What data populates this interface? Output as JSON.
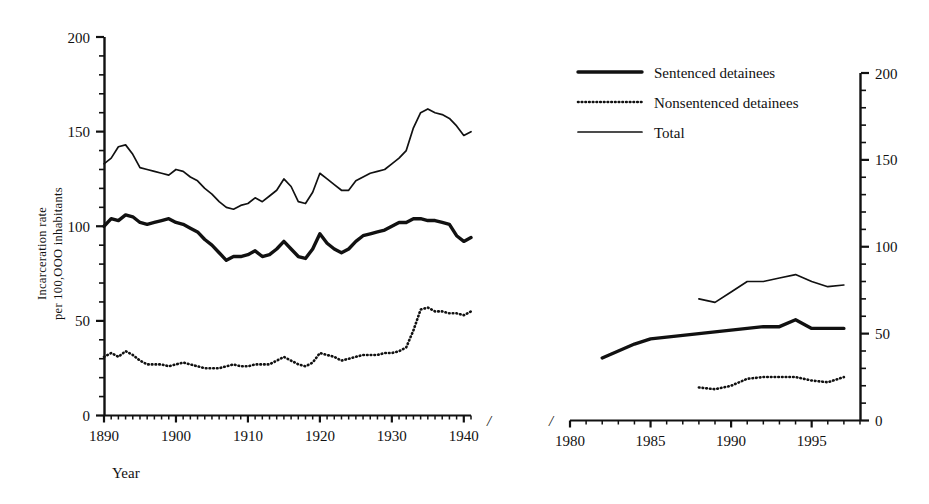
{
  "figure": {
    "background": "#ffffff",
    "ink": "#111111"
  },
  "axes": {
    "y_label_line1": "Incarceration rate",
    "y_label_line2": "per 100,OOO inhabitants",
    "x_label": "Year",
    "y_ticks": [
      "0",
      "50",
      "100",
      "150",
      "200"
    ],
    "y_tick_values": [
      0,
      50,
      100,
      150,
      200
    ],
    "y_minor_step": 10,
    "left_x_ticks": [
      "1890",
      "1900",
      "1910",
      "1920",
      "1930",
      "1940"
    ],
    "left_x_tick_values": [
      1890,
      1900,
      1910,
      1920,
      1930,
      1940
    ],
    "right_x_ticks": [
      "1980",
      "1985",
      "1990",
      "1995"
    ],
    "right_x_tick_values": [
      1980,
      1985,
      1990,
      1995
    ],
    "axis_break_glyph": "/"
  },
  "legend": {
    "position": "top-right",
    "items": [
      {
        "label": "Sentenced detainees",
        "style": "thick-solid"
      },
      {
        "label": "Nonsentenced detainees",
        "style": "dotted"
      },
      {
        "label": "Total",
        "style": "thin-solid"
      }
    ]
  },
  "chart_data": {
    "type": "line",
    "title": "",
    "xlabel": "Year",
    "ylabel": "Incarceration rate per 100,000 inhabitants",
    "ylim": [
      0,
      200
    ],
    "grid": false,
    "legend_position": "top-right",
    "axis_break": true,
    "panels": [
      {
        "name": "left-panel",
        "xlim": [
          1890,
          1941
        ],
        "series": [
          {
            "name": "Total",
            "style": "thin-solid",
            "x": [
              1890,
              1891,
              1892,
              1893,
              1894,
              1895,
              1896,
              1897,
              1898,
              1899,
              1900,
              1901,
              1902,
              1903,
              1904,
              1905,
              1906,
              1907,
              1908,
              1909,
              1910,
              1911,
              1912,
              1913,
              1914,
              1915,
              1916,
              1917,
              1918,
              1919,
              1920,
              1921,
              1922,
              1923,
              1924,
              1925,
              1926,
              1927,
              1928,
              1929,
              1930,
              1931,
              1932,
              1933,
              1934,
              1935,
              1936,
              1937,
              1938,
              1939,
              1940,
              1941
            ],
            "y": [
              133,
              136,
              142,
              143,
              138,
              131,
              130,
              129,
              128,
              127,
              130,
              129,
              126,
              124,
              120,
              117,
              113,
              110,
              109,
              111,
              112,
              115,
              113,
              116,
              119,
              125,
              121,
              113,
              112,
              118,
              128,
              125,
              122,
              119,
              119,
              124,
              126,
              128,
              129,
              130,
              133,
              136,
              140,
              152,
              160,
              162,
              160,
              159,
              157,
              153,
              148,
              150
            ]
          },
          {
            "name": "Sentenced detainees",
            "style": "thick-solid",
            "x": [
              1890,
              1891,
              1892,
              1893,
              1894,
              1895,
              1896,
              1897,
              1898,
              1899,
              1900,
              1901,
              1902,
              1903,
              1904,
              1905,
              1906,
              1907,
              1908,
              1909,
              1910,
              1911,
              1912,
              1913,
              1914,
              1915,
              1916,
              1917,
              1918,
              1919,
              1920,
              1921,
              1922,
              1923,
              1924,
              1925,
              1926,
              1927,
              1928,
              1929,
              1930,
              1931,
              1932,
              1933,
              1934,
              1935,
              1936,
              1937,
              1938,
              1939,
              1940,
              1941
            ],
            "y": [
              100,
              104,
              103,
              106,
              105,
              102,
              101,
              102,
              103,
              104,
              102,
              101,
              99,
              97,
              93,
              90,
              86,
              82,
              84,
              84,
              85,
              87,
              84,
              85,
              88,
              92,
              88,
              84,
              83,
              88,
              96,
              91,
              88,
              86,
              88,
              92,
              95,
              96,
              97,
              98,
              100,
              102,
              102,
              104,
              104,
              103,
              103,
              102,
              101,
              95,
              92,
              94
            ]
          },
          {
            "name": "Nonsentenced detainees",
            "style": "dotted",
            "x": [
              1890,
              1891,
              1892,
              1893,
              1894,
              1895,
              1896,
              1897,
              1898,
              1899,
              1900,
              1901,
              1902,
              1903,
              1904,
              1905,
              1906,
              1907,
              1908,
              1909,
              1910,
              1911,
              1912,
              1913,
              1914,
              1915,
              1916,
              1917,
              1918,
              1919,
              1920,
              1921,
              1922,
              1923,
              1924,
              1925,
              1926,
              1927,
              1928,
              1929,
              1930,
              1931,
              1932,
              1933,
              1934,
              1935,
              1936,
              1937,
              1938,
              1939,
              1940,
              1941
            ],
            "y": [
              31,
              33,
              31,
              34,
              32,
              29,
              27,
              27,
              27,
              26,
              27,
              28,
              27,
              26,
              25,
              25,
              25,
              26,
              27,
              26,
              26,
              27,
              27,
              27,
              29,
              31,
              29,
              27,
              26,
              28,
              33,
              32,
              31,
              29,
              30,
              31,
              32,
              32,
              32,
              33,
              33,
              34,
              36,
              45,
              56,
              57,
              55,
              55,
              54,
              54,
              53,
              55
            ]
          }
        ]
      },
      {
        "name": "right-panel",
        "xlim": [
          1980,
          1998
        ],
        "series": [
          {
            "name": "Total",
            "style": "thin-solid",
            "x": [
              1988,
              1989,
              1990,
              1991,
              1992,
              1993,
              1994,
              1995,
              1996,
              1997
            ],
            "y": [
              70,
              68,
              74,
              80,
              80,
              82,
              84,
              80,
              77,
              78
            ]
          },
          {
            "name": "Sentenced detainees",
            "style": "thick-solid",
            "x": [
              1982,
              1983,
              1984,
              1985,
              1986,
              1987,
              1988,
              1989,
              1990,
              1991,
              1992,
              1993,
              1994,
              1995,
              1996,
              1997
            ],
            "y": [
              36,
              40,
              44,
              47,
              48,
              49,
              50,
              51,
              52,
              53,
              54,
              54,
              58,
              53,
              53,
              53
            ]
          },
          {
            "name": "Nonsentenced detainees",
            "style": "dotted",
            "x": [
              1988,
              1989,
              1990,
              1991,
              1992,
              1993,
              1994,
              1995,
              1996,
              1997
            ],
            "y": [
              19,
              18,
              20,
              24,
              25,
              25,
              25,
              23,
              22,
              25
            ]
          }
        ]
      }
    ]
  }
}
